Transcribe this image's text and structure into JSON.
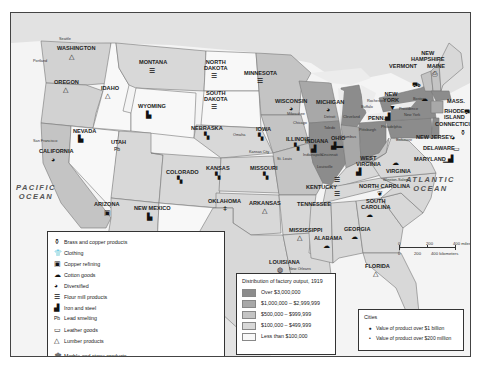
{
  "oceans": {
    "pacific": "PACIFIC\nOCEAN",
    "pacific_l1": "PACIFIC",
    "pacific_l2": "OCEAN",
    "atlantic_l1": "ATLANTIC",
    "atlantic_l2": "OCEAN",
    "gulf": "Gulf of Mexico"
  },
  "states": {
    "washington": "WASHINGTON",
    "oregon": "OREGON",
    "california": "CALIFORNIA",
    "nevada": "NEVADA",
    "idaho": "IDAHO",
    "montana": "MONTANA",
    "wyoming": "WYOMING",
    "utah": "UTAH",
    "arizona": "ARIZONA",
    "colorado": "COLORADO",
    "new_mexico_1": "NEW MEXICO",
    "north_dakota_1": "NORTH",
    "north_dakota_2": "DAKOTA",
    "south_dakota_1": "SOUTH",
    "south_dakota_2": "DAKOTA",
    "nebraska": "NEBRASKA",
    "kansas": "KANSAS",
    "oklahoma": "OKLAHOMA",
    "texas": "TEXAS",
    "minnesota": "MINNESOTA",
    "iowa": "IOWA",
    "missouri": "MISSOURI",
    "arkansas": "ARKANSAS",
    "louisiana": "LOUISIANA",
    "wisconsin": "WISCONSIN",
    "illinois": "ILLINOIS",
    "michigan": "MICHIGAN",
    "indiana": "INDIANA",
    "ohio": "OHIO",
    "kentucky": "KENTUCKY",
    "tennessee": "TENNESSEE",
    "mississippi": "MISSISSIPPI",
    "alabama": "ALABAMA",
    "georgia": "GEORGIA",
    "florida": "FLORIDA",
    "south_carolina_1": "SOUTH",
    "south_carolina_2": "CAROLINA",
    "north_carolina": "NORTH CAROLINA",
    "virginia": "VIRGINIA",
    "west_virginia_1": "WEST",
    "west_virginia_2": "VIRGINIA",
    "penn": "PENN.",
    "new_york_1": "NEW",
    "new_york_2": "YORK",
    "vermont": "VERMONT",
    "new_hampshire_1": "NEW",
    "new_hampshire_2": "HAMPSHIRE",
    "maine": "MAINE",
    "mass": "MASS.",
    "rhode_island_1": "RHODE",
    "rhode_island_2": "ISLAND",
    "connecticut": "CONNECTICUT",
    "new_jersey": "NEW JERSEY",
    "delaware": "DELAWARE",
    "maryland": "MARYLAND"
  },
  "cities": {
    "seattle": "Seattle",
    "portland": "Portland",
    "san_francisco": "San Francisco",
    "omaha": "Omaha",
    "kansas_city": "Kansas City",
    "st_louis": "St. Louis",
    "chicago": "Chicago",
    "milwaukee": "Milwaukee",
    "detroit": "Detroit",
    "toledo": "Toledo",
    "cleveland": "Cleveland",
    "buffalo": "Buffalo",
    "rochester": "Rochester",
    "columbus": "Columbus",
    "cincinnati": "Cincinnati",
    "indianapolis": "Indianapolis",
    "louisville": "Louisville",
    "pittsburgh": "Pittsburgh",
    "philadelphia": "Philadelphia",
    "new_york": "New York",
    "boston": "Boston",
    "providence": "Providence",
    "baltimore": "Baltimore",
    "winston_salem": "Winston-Salem",
    "new_orleans": "New Orleans"
  },
  "legend_products": {
    "left": [
      {
        "icon": "brass-copper-icon",
        "glyph": "⚱",
        "label": "Brass and copper products"
      },
      {
        "icon": "clothing-icon",
        "glyph": "👕",
        "label": "Clothing"
      },
      {
        "icon": "copper-refining-icon",
        "glyph": "▣",
        "label": "Copper refining"
      },
      {
        "icon": "cotton-goods-icon",
        "glyph": "☁",
        "label": "Cotton goods"
      },
      {
        "icon": "diversified-icon",
        "glyph": "◕",
        "label": "Diversified"
      },
      {
        "icon": "flour-mill-icon",
        "glyph": "☰",
        "label": "Flour mill products"
      },
      {
        "icon": "iron-steel-icon",
        "glyph": "▟",
        "label": "Iron and steel"
      },
      {
        "icon": "lead-smelting-icon",
        "glyph": "Pb",
        "label": "Lead smelting"
      },
      {
        "icon": "leather-goods-icon",
        "glyph": "▭",
        "label": "Leather goods"
      },
      {
        "icon": "lumber-icon",
        "glyph": "△",
        "label": "Lumber products"
      }
    ],
    "right": [
      {
        "icon": "marble-stone-icon",
        "glyph": "🏛",
        "label": "Marble and stone products"
      },
      {
        "icon": "meat-packing-icon",
        "glyph": "🐄",
        "label": "Meat packing"
      },
      {
        "icon": "paper-icon",
        "glyph": "⎙",
        "label": "Paper"
      },
      {
        "icon": "petroleum-icon",
        "glyph": "⛽",
        "label": "Petroleum refining"
      },
      {
        "icon": "railroad-icon",
        "glyph": "▙",
        "label": "Products for railroads"
      },
      {
        "icon": "rubber-icon",
        "glyph": "▬",
        "label": "Rubber products"
      },
      {
        "icon": "shipbuilding-icon",
        "glyph": "⛴",
        "label": "Shipbuilding"
      },
      {
        "icon": "sugar-icon",
        "glyph": "◍",
        "label": "Sugar refining"
      },
      {
        "icon": "tobacco-icon",
        "glyph": "❦",
        "label": "Tobacco products"
      },
      {
        "icon": "woolen-icon",
        "glyph": "⛟",
        "label": "Woolen goods"
      }
    ]
  },
  "legend_distribution": {
    "title": "Distribution of factory output, 1919",
    "rows": [
      {
        "label": "Over $3,000,000",
        "color": "#8c8c8c"
      },
      {
        "label": "$1,000,000 – $2,999,999",
        "color": "#a8a8a8"
      },
      {
        "label": "$500,000 – $999,999",
        "color": "#c4c4c4"
      },
      {
        "label": "$100,000 – $499,999",
        "color": "#d8d8d8"
      },
      {
        "label": "Less than $100,000",
        "color": "#f8f8f8"
      }
    ]
  },
  "legend_cities": {
    "title": "Cities",
    "rows": [
      {
        "marker": "●",
        "label": "Value of product over $1 billion"
      },
      {
        "marker": "•",
        "label": "Value of product over $200 million"
      }
    ]
  },
  "scale": {
    "m0": "0",
    "m200": "200",
    "m400": "400 miles",
    "k0": "0",
    "k200": "200",
    "k400": "400 kilometers"
  }
}
